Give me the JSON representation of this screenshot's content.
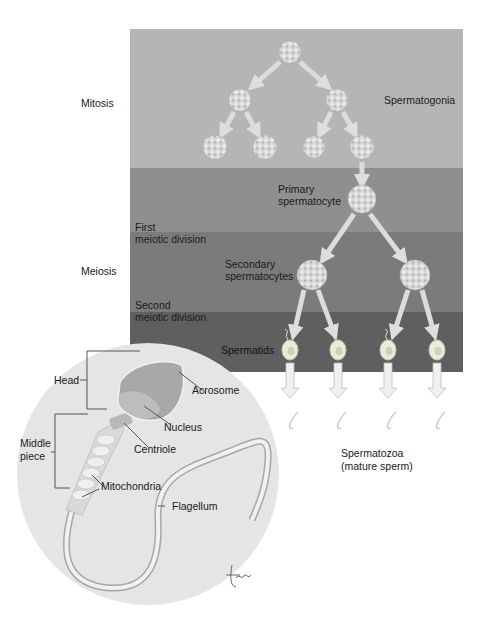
{
  "diagram": {
    "title_fragment": "",
    "stages": {
      "mitosis": "Mitosis",
      "meiosis": "Meiosis",
      "first_meiotic_division": [
        "First",
        "meiotic division"
      ],
      "second_meiotic_division": [
        "Second",
        "meiotic division"
      ]
    },
    "cells": {
      "spermatogonia": "Spermatogonia",
      "primary_spermatocyte": [
        "Primary",
        "spermatocyte"
      ],
      "secondary_spermatocytes": [
        "Secondary",
        "spermatocytes"
      ],
      "spermatids": "Spermatids",
      "spermatozoa": [
        "Spermatozoa",
        "(mature sperm)"
      ]
    },
    "sperm_anatomy": {
      "head": "Head",
      "middle_piece": [
        "Middle",
        "piece"
      ],
      "acrosome": "Acrosome",
      "nucleus": "Nucleus",
      "centriole": "Centriole",
      "mitochondria": "Mitochondria",
      "flagellum": "Flagellum"
    },
    "signature": "tina",
    "colors": {
      "band_mitosis": "#b4b4b4",
      "band_primary": "#8f8f8f",
      "band_secondary": "#7a7a7a",
      "band_spermatid": "#5e5e5e",
      "arrow": "#dedede",
      "cell": "#cfcfcf",
      "inset_circle": "#e4e4e4"
    }
  }
}
